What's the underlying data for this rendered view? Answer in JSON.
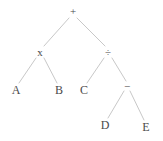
{
  "figure": {
    "kind": "binary-expression-tree",
    "background_color": "#ffffff",
    "edge_color": "#c8c8c8",
    "node_text_color": "#4a4a4a",
    "width": 163,
    "height": 141
  },
  "nodes": [
    {
      "id": "root",
      "label": "+",
      "kind": "operator",
      "x": 73,
      "y": 11
    },
    {
      "id": "mul",
      "label": "x",
      "kind": "operator",
      "x": 40,
      "y": 52
    },
    {
      "id": "div",
      "label": "÷",
      "kind": "operator",
      "x": 108,
      "y": 52
    },
    {
      "id": "a",
      "label": "A",
      "kind": "operand",
      "x": 16,
      "y": 90
    },
    {
      "id": "b",
      "label": "B",
      "kind": "operand",
      "x": 59,
      "y": 90
    },
    {
      "id": "c",
      "label": "C",
      "kind": "operand",
      "x": 84,
      "y": 90
    },
    {
      "id": "sub",
      "label": "−",
      "kind": "operator",
      "x": 127,
      "y": 86
    },
    {
      "id": "d",
      "label": "D",
      "kind": "operand",
      "x": 105,
      "y": 125
    },
    {
      "id": "e",
      "label": "E",
      "kind": "operand",
      "x": 146,
      "y": 127
    }
  ],
  "edges": [
    {
      "from": "root",
      "to": "mul",
      "x1": 69,
      "y1": 18,
      "x2": 44,
      "y2": 46
    },
    {
      "from": "root",
      "to": "div",
      "x1": 77,
      "y1": 18,
      "x2": 105,
      "y2": 46
    },
    {
      "from": "mul",
      "to": "a",
      "x1": 36,
      "y1": 58,
      "x2": 19,
      "y2": 83
    },
    {
      "from": "mul",
      "to": "b",
      "x1": 44,
      "y1": 58,
      "x2": 57,
      "y2": 83
    },
    {
      "from": "div",
      "to": "c",
      "x1": 104,
      "y1": 58,
      "x2": 87,
      "y2": 83
    },
    {
      "from": "div",
      "to": "sub",
      "x1": 112,
      "y1": 58,
      "x2": 126,
      "y2": 81
    },
    {
      "from": "sub",
      "to": "d",
      "x1": 124,
      "y1": 91,
      "x2": 108,
      "y2": 118
    },
    {
      "from": "sub",
      "to": "e",
      "x1": 130,
      "y1": 91,
      "x2": 144,
      "y2": 120
    }
  ]
}
